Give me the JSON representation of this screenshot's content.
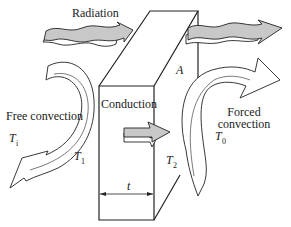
{
  "figure": {
    "type": "heat-transfer-through-wall",
    "labels": {
      "radiation": "Radiation",
      "free_convection": "Free convection",
      "conduction": "Conduction",
      "forced_convection_line1": "Forced",
      "forced_convection_line2": "convection",
      "area": "A",
      "thickness": "t"
    },
    "temperatures": {
      "inner": {
        "symbol": "T",
        "subscript": "i"
      },
      "surface_1": {
        "symbol": "T",
        "subscript": "1"
      },
      "surface_2": {
        "symbol": "T",
        "subscript": "2"
      },
      "outer": {
        "symbol": "T",
        "subscript": "0"
      }
    },
    "colors": {
      "line": "#222222",
      "arrow_fill_gray": "#c8c8c8",
      "background": "#ffffff"
    }
  }
}
